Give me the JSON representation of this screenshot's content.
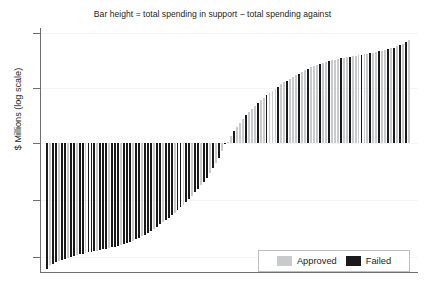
{
  "chart_data": {
    "type": "bar",
    "title": "Bar height = total spending in support − total spending against",
    "xlabel": "",
    "ylabel": "$ Millions (log scale)",
    "grid": true,
    "legend_position": "bottom-right",
    "y_scale": "symlog",
    "zero_baseline": true,
    "x_tick_labels": [],
    "y_tick_labels": [],
    "n_ticks": 5,
    "colors": {
      "approved": "#c9cacb",
      "failed": "#1a1a1a",
      "axis": "#6d6e71",
      "grid": "#f4f4f5",
      "background": "#ffffff",
      "text": "#231f20",
      "legend_border": "#bcbec0"
    },
    "series": [
      {
        "name": "Approved",
        "color": "#c9cacb"
      },
      {
        "name": "Failed",
        "color": "#1a1a1a"
      }
    ],
    "bars": [
      {
        "v": -127.0,
        "s": "Failed"
      },
      {
        "v": -96.0,
        "s": "Approved"
      },
      {
        "v": -86.0,
        "s": "Failed"
      },
      {
        "v": -78.0,
        "s": "Failed"
      },
      {
        "v": -71.0,
        "s": "Approved"
      },
      {
        "v": -66.0,
        "s": "Failed"
      },
      {
        "v": -61.0,
        "s": "Failed"
      },
      {
        "v": -57.0,
        "s": "Approved"
      },
      {
        "v": -54.0,
        "s": "Failed"
      },
      {
        "v": -51.0,
        "s": "Failed"
      },
      {
        "v": -48.5,
        "s": "Approved"
      },
      {
        "v": -46.0,
        "s": "Failed"
      },
      {
        "v": -44.0,
        "s": "Failed"
      },
      {
        "v": -42.0,
        "s": "Approved"
      },
      {
        "v": -40.0,
        "s": "Failed"
      },
      {
        "v": -38.5,
        "s": "Failed"
      },
      {
        "v": -37.0,
        "s": "Failed"
      },
      {
        "v": -35.5,
        "s": "Approved"
      },
      {
        "v": -34.0,
        "s": "Failed"
      },
      {
        "v": -32.5,
        "s": "Failed"
      },
      {
        "v": -31.0,
        "s": "Failed"
      },
      {
        "v": -29.5,
        "s": "Approved"
      },
      {
        "v": -28.0,
        "s": "Failed"
      },
      {
        "v": -26.5,
        "s": "Failed"
      },
      {
        "v": -25.0,
        "s": "Failed"
      },
      {
        "v": -23.5,
        "s": "Approved"
      },
      {
        "v": -22.0,
        "s": "Failed"
      },
      {
        "v": -20.5,
        "s": "Failed"
      },
      {
        "v": -19.0,
        "s": "Failed"
      },
      {
        "v": -17.5,
        "s": "Approved"
      },
      {
        "v": -16.0,
        "s": "Failed"
      },
      {
        "v": -14.5,
        "s": "Failed"
      },
      {
        "v": -13.0,
        "s": "Approved"
      },
      {
        "v": -11.5,
        "s": "Failed"
      },
      {
        "v": -10.0,
        "s": "Failed"
      },
      {
        "v": -8.8,
        "s": "Failed"
      },
      {
        "v": -7.6,
        "s": "Approved"
      },
      {
        "v": -6.6,
        "s": "Failed"
      },
      {
        "v": -5.7,
        "s": "Failed"
      },
      {
        "v": -4.9,
        "s": "Approved"
      },
      {
        "v": -4.2,
        "s": "Failed"
      },
      {
        "v": -3.6,
        "s": "Failed"
      },
      {
        "v": -3.0,
        "s": "Failed"
      },
      {
        "v": -2.5,
        "s": "Approved"
      },
      {
        "v": -2.1,
        "s": "Failed"
      },
      {
        "v": -1.75,
        "s": "Failed"
      },
      {
        "v": -1.45,
        "s": "Approved"
      },
      {
        "v": -1.2,
        "s": "Failed"
      },
      {
        "v": -0.95,
        "s": "Failed"
      },
      {
        "v": -0.78,
        "s": "Approved"
      },
      {
        "v": -0.62,
        "s": "Failed"
      },
      {
        "v": -0.49,
        "s": "Failed"
      },
      {
        "v": -0.38,
        "s": "Approved"
      },
      {
        "v": -0.29,
        "s": "Failed"
      },
      {
        "v": -0.22,
        "s": "Failed"
      },
      {
        "v": -0.16,
        "s": "Approved"
      },
      {
        "v": -0.115,
        "s": "Failed"
      },
      {
        "v": -0.08,
        "s": "Approved"
      },
      {
        "v": -0.055,
        "s": "Failed"
      },
      {
        "v": -0.035,
        "s": "Approved"
      },
      {
        "v": -0.02,
        "s": "Failed"
      },
      {
        "v": 0.02,
        "s": "Approved"
      },
      {
        "v": 0.035,
        "s": "Approved"
      },
      {
        "v": 0.055,
        "s": "Failed"
      },
      {
        "v": 0.08,
        "s": "Approved"
      },
      {
        "v": 0.115,
        "s": "Approved"
      },
      {
        "v": 0.16,
        "s": "Approved"
      },
      {
        "v": 0.22,
        "s": "Failed"
      },
      {
        "v": 0.29,
        "s": "Approved"
      },
      {
        "v": 0.38,
        "s": "Approved"
      },
      {
        "v": 0.49,
        "s": "Approved"
      },
      {
        "v": 0.62,
        "s": "Failed"
      },
      {
        "v": 0.78,
        "s": "Approved"
      },
      {
        "v": 0.95,
        "s": "Approved"
      },
      {
        "v": 1.2,
        "s": "Failed"
      },
      {
        "v": 1.45,
        "s": "Approved"
      },
      {
        "v": 1.75,
        "s": "Approved"
      },
      {
        "v": 2.1,
        "s": "Approved"
      },
      {
        "v": 2.5,
        "s": "Failed"
      },
      {
        "v": 3.0,
        "s": "Approved"
      },
      {
        "v": 3.6,
        "s": "Approved"
      },
      {
        "v": 4.2,
        "s": "Failed"
      },
      {
        "v": 4.9,
        "s": "Approved"
      },
      {
        "v": 5.7,
        "s": "Approved"
      },
      {
        "v": 6.6,
        "s": "Approved"
      },
      {
        "v": 7.6,
        "s": "Failed"
      },
      {
        "v": 8.8,
        "s": "Approved"
      },
      {
        "v": 10.0,
        "s": "Approved"
      },
      {
        "v": 11.5,
        "s": "Failed"
      },
      {
        "v": 13.0,
        "s": "Approved"
      },
      {
        "v": 14.5,
        "s": "Approved"
      },
      {
        "v": 16.0,
        "s": "Approved"
      },
      {
        "v": 17.5,
        "s": "Failed"
      },
      {
        "v": 19.0,
        "s": "Approved"
      },
      {
        "v": 20.5,
        "s": "Approved"
      },
      {
        "v": 22.0,
        "s": "Failed"
      },
      {
        "v": 23.5,
        "s": "Approved"
      },
      {
        "v": 25.0,
        "s": "Approved"
      },
      {
        "v": 26.5,
        "s": "Approved"
      },
      {
        "v": 28.0,
        "s": "Failed"
      },
      {
        "v": 29.5,
        "s": "Approved"
      },
      {
        "v": 31.0,
        "s": "Approved"
      },
      {
        "v": 32.5,
        "s": "Failed"
      },
      {
        "v": 34.0,
        "s": "Approved"
      },
      {
        "v": 35.5,
        "s": "Approved"
      },
      {
        "v": 37.0,
        "s": "Approved"
      },
      {
        "v": 38.5,
        "s": "Failed"
      },
      {
        "v": 40.0,
        "s": "Approved"
      },
      {
        "v": 42.0,
        "s": "Approved"
      },
      {
        "v": 44.0,
        "s": "Failed"
      },
      {
        "v": 46.0,
        "s": "Approved"
      },
      {
        "v": 48.5,
        "s": "Approved"
      },
      {
        "v": 51.0,
        "s": "Failed"
      },
      {
        "v": 54.0,
        "s": "Approved"
      },
      {
        "v": 57.0,
        "s": "Approved"
      },
      {
        "v": 61.0,
        "s": "Failed"
      },
      {
        "v": 66.0,
        "s": "Approved"
      },
      {
        "v": 71.0,
        "s": "Failed"
      },
      {
        "v": 78.0,
        "s": "Approved"
      },
      {
        "v": 86.0,
        "s": "Failed"
      },
      {
        "v": 96.0,
        "s": "Approved"
      },
      {
        "v": 112.0,
        "s": "Failed"
      },
      {
        "v": 135.0,
        "s": "Approved"
      }
    ]
  },
  "legend": {
    "approved_label": "Approved",
    "failed_label": "Failed"
  }
}
